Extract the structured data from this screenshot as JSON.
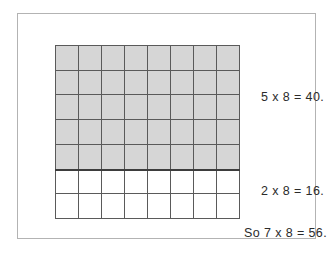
{
  "figure": {
    "type": "area-model-multiplication",
    "grid": {
      "columns": 8,
      "rows": 7,
      "shaded_rows": 5,
      "unshaded_rows": 2,
      "shaded_color": "#d6d6d6",
      "unshaded_color": "#ffffff",
      "line_color": "#5a5a5a",
      "divider_color": "#3d3d3d"
    },
    "frame": {
      "border_color": "#b3b3b3",
      "background": "#ffffff"
    },
    "annotations": {
      "shaded_part": "5 x 8 = 40.",
      "unshaded_part": "2 x 8 = 16.",
      "total": "So 7 x 8 = 56."
    },
    "text_color": "#2b2b2b"
  },
  "chart_data": {
    "type": "table",
    "title": "",
    "categories": [
      "shaded rows (5 x 8)",
      "unshaded rows (2 x 8)",
      "total (7 x 8)"
    ],
    "values": [
      40,
      16,
      56
    ],
    "grid_columns": 8,
    "grid_rows": 7,
    "shaded_rows": 5,
    "unshaded_rows": 2,
    "labels": [
      "5 x 8 = 40.",
      "2 x 8 = 16.",
      "So 7 x 8 = 56."
    ],
    "xlabel": "",
    "ylabel": "",
    "grid": true,
    "legend": "none"
  }
}
